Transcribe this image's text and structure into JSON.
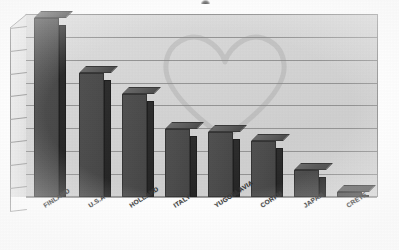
{
  "chart_data": {
    "type": "bar",
    "title": "",
    "subtitle": "",
    "xlabel": "",
    "ylabel": "",
    "categories": [
      "FINLAND",
      "U.S.A",
      "HOLLAND",
      "ITALY",
      "YUGOSLAVIA",
      "CORFU",
      "JAPAN",
      "CRETE"
    ],
    "values": [
      7.85,
      5.45,
      4.5,
      3.0,
      2.85,
      2.45,
      1.2,
      0.1
    ],
    "series": [
      {
        "name": "",
        "values": [
          7.85,
          5.45,
          4.5,
          3.0,
          2.85,
          2.45,
          1.2,
          0.1
        ]
      }
    ],
    "ylim": [
      0,
      8
    ],
    "y_tick_labels": [],
    "gridline_count": 8,
    "grid": true,
    "legend": false,
    "legend_position": "none",
    "style_3d": true,
    "annotations": []
  },
  "figure": {
    "bar_face_color": "#4a4a4a",
    "bar_side_color": "#2a2a2a",
    "bar_top_color": "#5a5a5a",
    "wall_color": "#d6d6d6",
    "gridline_color": "#8a8a8a",
    "axis_color": "#8d8d8d",
    "page_color": "#ffffff",
    "label_color": "#2e2e2e"
  },
  "bars": [
    {
      "label": "FINLAND",
      "value": 7.85,
      "left": 34,
      "width": 25,
      "top": 18,
      "label_x": 42,
      "label_y": 203
    },
    {
      "label": "U.S.A",
      "value": 5.45,
      "left": 79,
      "width": 25,
      "top": 73,
      "label_x": 87,
      "label_y": 203
    },
    {
      "label": "HOLLAND",
      "value": 4.5,
      "left": 122,
      "width": 25,
      "top": 94,
      "label_x": 128,
      "label_y": 203
    },
    {
      "label": "ITALY",
      "value": 3.0,
      "left": 165,
      "width": 25,
      "top": 129,
      "label_x": 172,
      "label_y": 203
    },
    {
      "label": "YUGOSLAVIA",
      "value": 2.85,
      "left": 208,
      "width": 25,
      "top": 132,
      "label_x": 213,
      "label_y": 203
    },
    {
      "label": "CORFU",
      "value": 2.45,
      "left": 251,
      "width": 25,
      "top": 141,
      "label_x": 259,
      "label_y": 203
    },
    {
      "label": "JAPAN",
      "value": 1.2,
      "left": 294,
      "width": 25,
      "top": 170,
      "label_x": 302,
      "label_y": 203
    },
    {
      "label": "CRETE",
      "value": 0.1,
      "left": 337,
      "width": 25,
      "top": 192,
      "label_x": 345,
      "label_y": 203
    }
  ],
  "gridlines": {
    "y_positions": [
      14,
      37,
      60,
      83,
      105,
      128,
      151,
      174,
      197
    ]
  },
  "accessibility": {
    "chart_description": "Three-dimensional vertical bar chart comparing eight locations; bars decrease from Finland down to Crete."
  }
}
